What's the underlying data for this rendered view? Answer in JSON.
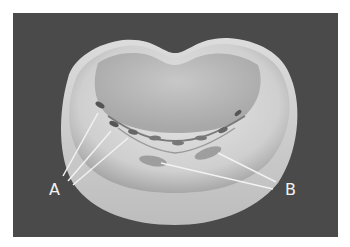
{
  "figure": {
    "background_color": "#4a4a4a",
    "labels": [
      {
        "id": "A",
        "text": "A"
      },
      {
        "id": "B",
        "text": "B"
      }
    ]
  }
}
